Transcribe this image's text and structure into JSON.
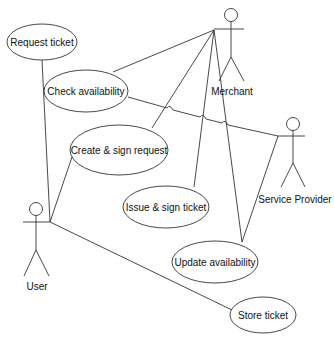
{
  "diagram": {
    "type": "uml-use-case",
    "actors": [
      {
        "id": "merchant",
        "label": "Merchant",
        "x": 231,
        "y": 15,
        "label_x": 232,
        "label_y": 95
      },
      {
        "id": "service_provider",
        "label": "Service Provider",
        "x": 293,
        "y": 124,
        "label_x": 295,
        "label_y": 203
      },
      {
        "id": "user",
        "label": "User",
        "x": 36,
        "y": 209,
        "label_x": 37,
        "label_y": 290
      }
    ],
    "use_cases": [
      {
        "id": "request_ticket",
        "label": "Request ticket",
        "cx": 42,
        "cy": 42,
        "rx": 35,
        "ry": 18
      },
      {
        "id": "check_availability",
        "label": "Check availability",
        "cx": 86,
        "cy": 91,
        "rx": 42,
        "ry": 21
      },
      {
        "id": "create_sign_request",
        "label": "Create & sign request",
        "cx": 119,
        "cy": 150,
        "rx": 49,
        "ry": 25
      },
      {
        "id": "issue_sign_ticket",
        "label": "Issue & sign ticket",
        "cx": 166,
        "cy": 207,
        "rx": 43,
        "ry": 21
      },
      {
        "id": "update_availability",
        "label": "Update availability",
        "cx": 215,
        "cy": 262,
        "rx": 43,
        "ry": 21
      },
      {
        "id": "store_ticket",
        "label": "Store ticket",
        "cx": 263,
        "cy": 315,
        "rx": 33,
        "ry": 18
      }
    ],
    "associations": [
      {
        "from": "user",
        "to": "request_ticket"
      },
      {
        "from": "user",
        "to": "create_sign_request"
      },
      {
        "from": "user",
        "to": "store_ticket"
      },
      {
        "from": "merchant",
        "to": "check_availability"
      },
      {
        "from": "merchant",
        "to": "create_sign_request"
      },
      {
        "from": "merchant",
        "to": "issue_sign_ticket"
      },
      {
        "from": "merchant",
        "to": "update_availability"
      },
      {
        "from": "service_provider",
        "to": "check_availability"
      },
      {
        "from": "service_provider",
        "to": "update_availability"
      }
    ]
  }
}
